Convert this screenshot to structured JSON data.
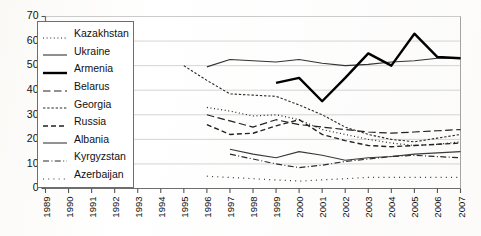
{
  "chart_data": {
    "type": "line",
    "title": "",
    "xlabel": "",
    "ylabel": "",
    "xlim": [
      1989,
      2007
    ],
    "ylim": [
      0,
      70
    ],
    "grid": true,
    "legend_position": "upper-left-inside",
    "x": [
      1989,
      1990,
      1991,
      1992,
      1993,
      1994,
      1995,
      1996,
      1997,
      1998,
      1999,
      2000,
      2001,
      2002,
      2003,
      2004,
      2005,
      2006,
      2007
    ],
    "xtick_labels": [
      "1989",
      "1990",
      "1991",
      "1992",
      "1993",
      "1994",
      "1995",
      "1996",
      "1997",
      "1998",
      "1999",
      "2000",
      "2001",
      "2002",
      "2003",
      "2004",
      "2005",
      "2006",
      "2007"
    ],
    "ytick_labels": [
      "0",
      "10",
      "20",
      "30",
      "40",
      "50",
      "60",
      "70"
    ],
    "ytick_values": [
      0,
      10,
      20,
      30,
      40,
      50,
      60,
      70
    ],
    "series": [
      {
        "name": "Kazakhstan",
        "style": "dotted",
        "width": 1.2,
        "color": "#222222",
        "x": [
          1996,
          1997,
          1998,
          1999,
          2000,
          2001,
          2002,
          2003,
          2004,
          2005,
          2006,
          2007
        ],
        "values": [
          33.0,
          31.5,
          29.5,
          30.0,
          28.0,
          24.0,
          22.0,
          20.0,
          18.5,
          17.5,
          18.0,
          19.0
        ]
      },
      {
        "name": "Ukraine",
        "style": "solid-thin",
        "width": 1.1,
        "color": "#333333",
        "x": [
          1996,
          1997,
          1998,
          1999,
          2000,
          2001,
          2002,
          2003,
          2004,
          2005,
          2006,
          2007
        ],
        "values": [
          49.5,
          52.5,
          52.0,
          51.5,
          52.5,
          51.0,
          50.0,
          50.5,
          51.5,
          52.0,
          53.0,
          53.0
        ]
      },
      {
        "name": "Armenia",
        "style": "solid-thick",
        "width": 2.4,
        "color": "#000000",
        "x": [
          1999,
          2000,
          2001,
          2002,
          2003,
          2004,
          2005,
          2006,
          2007
        ],
        "values": [
          43.0,
          45.0,
          35.5,
          45.0,
          55.0,
          50.0,
          63.0,
          53.5,
          53.0
        ]
      },
      {
        "name": "Belarus",
        "style": "dashed-long",
        "width": 1.2,
        "color": "#222222",
        "x": [
          1996,
          1997,
          1998,
          1999,
          2000,
          2001,
          2002,
          2003,
          2004,
          2005,
          2006,
          2007
        ],
        "values": [
          30.0,
          27.5,
          25.0,
          28.0,
          26.0,
          25.0,
          24.0,
          23.0,
          22.5,
          23.0,
          23.5,
          24.0
        ]
      },
      {
        "name": "Georgia",
        "style": "dashed-fine",
        "width": 1.1,
        "color": "#2a2a2a",
        "x": [
          1995,
          1996,
          1997,
          1998,
          1999,
          2000,
          2001,
          2002,
          2003,
          2004,
          2005,
          2006,
          2007
        ],
        "values": [
          50.0,
          44.0,
          38.5,
          38.0,
          37.5,
          34.0,
          30.0,
          25.0,
          22.0,
          20.0,
          19.0,
          20.5,
          22.0
        ]
      },
      {
        "name": "Russia",
        "style": "dashed-medium",
        "width": 1.4,
        "color": "#222222",
        "x": [
          1996,
          1997,
          1998,
          1999,
          2000,
          2001,
          2002,
          2003,
          2004,
          2005,
          2006,
          2007
        ],
        "values": [
          26.0,
          22.0,
          22.5,
          25.5,
          28.0,
          22.0,
          19.5,
          17.5,
          17.0,
          17.5,
          18.0,
          18.5
        ]
      },
      {
        "name": "Albania",
        "style": "solid-thin",
        "width": 1.1,
        "color": "#3a3a3a",
        "x": [
          1997,
          1998,
          1999,
          2000,
          2001,
          2002,
          2003,
          2004,
          2005,
          2006,
          2007
        ],
        "values": [
          16.0,
          14.0,
          12.5,
          15.0,
          13.5,
          11.5,
          12.5,
          13.0,
          14.0,
          14.5,
          15.0
        ]
      },
      {
        "name": "Kyrgyzstan",
        "style": "dash-dot",
        "width": 1.2,
        "color": "#2a2a2a",
        "x": [
          1997,
          1998,
          1999,
          2000,
          2001,
          2002,
          2003,
          2004,
          2005,
          2006,
          2007
        ],
        "values": [
          14.0,
          12.0,
          10.0,
          8.5,
          9.5,
          11.0,
          12.0,
          13.0,
          13.5,
          13.0,
          12.5
        ]
      },
      {
        "name": "Azerbaijan",
        "style": "dotted-sparse",
        "width": 1.2,
        "color": "#333333",
        "x": [
          1996,
          1997,
          1998,
          1999,
          2000,
          2001,
          2002,
          2003,
          2004,
          2005,
          2006,
          2007
        ],
        "values": [
          5.0,
          4.5,
          4.0,
          3.5,
          3.0,
          3.5,
          4.0,
          4.5,
          4.5,
          4.5,
          4.5,
          4.5
        ]
      }
    ]
  },
  "legend": {
    "items": [
      {
        "label": "Kazakhstan"
      },
      {
        "label": "Ukraine"
      },
      {
        "label": "Armenia"
      },
      {
        "label": "Belarus"
      },
      {
        "label": "Georgia"
      },
      {
        "label": "Russia"
      },
      {
        "label": "Albania"
      },
      {
        "label": "Kyrgyzstan"
      },
      {
        "label": "Azerbaijan"
      }
    ]
  }
}
